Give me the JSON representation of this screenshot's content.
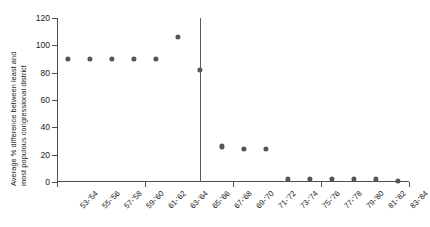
{
  "chart_data": {
    "type": "scatter",
    "title": "",
    "xlabel": "",
    "ylabel": "Average % difference between least and most populous congressional district",
    "ylabel_line1": "Average % difference between least and",
    "ylabel_line2": "most populous congressional district",
    "ylim": [
      0,
      120
    ],
    "yticks": [
      0,
      20,
      40,
      60,
      80,
      100,
      120
    ],
    "ytick_labels": [
      "0",
      "20",
      "40",
      "60",
      "80",
      "100",
      "120"
    ],
    "grid": false,
    "legend": null,
    "marker_color": "#555555",
    "axis_color": "#4d4d4d",
    "reference_line": {
      "label": "65-'54 boundary",
      "x_category": "65-'66",
      "color": "#5a5a5a",
      "y_from": 0,
      "y_to": 120
    },
    "categories": [
      "53-'54",
      "55-'56",
      "57-'58",
      "59-'60",
      "61-'62",
      "63-'64",
      "65-'66",
      "67-'68",
      "69-'70",
      "71-'72",
      "73-'74",
      "75-'76",
      "77-'78",
      "79-'80",
      "81-'82",
      "83-'84"
    ],
    "values": [
      90,
      90,
      90,
      90,
      90,
      106,
      82,
      26,
      24,
      24,
      2,
      2,
      2,
      2,
      2,
      1
    ]
  }
}
